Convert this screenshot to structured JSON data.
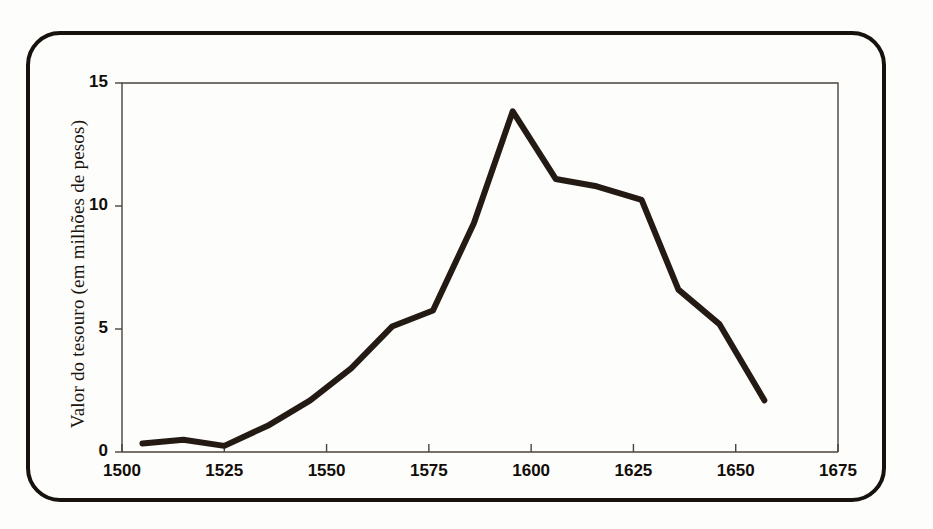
{
  "figure": {
    "frame_color": "#17120d",
    "background": "#fdfdfb"
  },
  "chart_data": {
    "type": "line",
    "title": "",
    "xlabel": "",
    "ylabel": "Valor do tesouro (em milhões de pesos)",
    "xlim": [
      1500,
      1675
    ],
    "ylim": [
      0,
      15
    ],
    "grid": false,
    "legend": null,
    "line_color": "#231a14",
    "line_width": 6,
    "xticks": [
      1500,
      1525,
      1550,
      1575,
      1600,
      1625,
      1650,
      1675
    ],
    "xtick_labels": [
      "1500",
      "1525",
      "1550",
      "1575",
      "1600",
      "1625",
      "1650",
      "1675"
    ],
    "yticks": [
      0,
      5,
      10,
      15
    ],
    "ytick_labels": [
      "0",
      "5",
      "10",
      "15"
    ],
    "x": [
      1505,
      1515,
      1525,
      1536,
      1546,
      1556,
      1566,
      1576,
      1586,
      1595.5,
      1606,
      1616,
      1627,
      1636,
      1646,
      1657
    ],
    "values": [
      0.35,
      0.5,
      0.25,
      1.1,
      2.1,
      3.4,
      5.1,
      5.75,
      9.3,
      13.85,
      11.1,
      10.8,
      10.25,
      6.6,
      5.2,
      2.1
    ],
    "series": [
      {
        "name": "Valor do tesouro",
        "values": [
          0.35,
          0.5,
          0.25,
          1.1,
          2.1,
          3.4,
          5.1,
          5.75,
          9.3,
          13.85,
          11.1,
          10.8,
          10.25,
          6.6,
          5.2,
          2.1
        ]
      }
    ]
  }
}
